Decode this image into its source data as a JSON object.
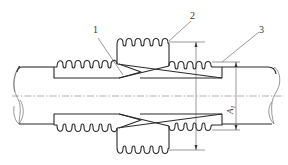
{
  "diagram": {
    "type": "technical-drawing",
    "callouts": [
      {
        "id": "1",
        "label": "1",
        "target": "inner crossed guide / liner"
      },
      {
        "id": "2",
        "label": "2",
        "target": "middle bellows"
      },
      {
        "id": "3",
        "label": "3",
        "target": "outer right bellows"
      }
    ],
    "dimensions": [
      {
        "id": "A",
        "label": "A",
        "subscript": "1"
      }
    ],
    "colors": {
      "stroke": "#2a2a2a",
      "centerline": "#7a7a7a",
      "background": "#ffffff"
    }
  }
}
